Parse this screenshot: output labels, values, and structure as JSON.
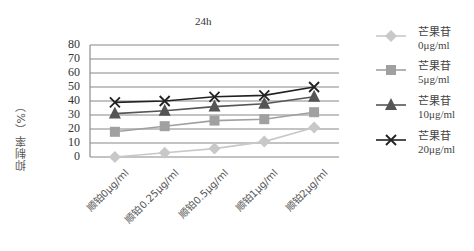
{
  "chart_data": {
    "type": "line",
    "title": "24h",
    "xlabel": "",
    "ylabel": "抑制率（%）",
    "ylim": [
      0,
      80
    ],
    "yticks": [
      0,
      10,
      20,
      30,
      40,
      50,
      60,
      70,
      80
    ],
    "grid": true,
    "legend_position": "right",
    "categories": [
      "顺铂0μg/ml",
      "顺铂0.25μg/ml",
      "顺铂0.5μg/ml",
      "顺铂1μg/ml",
      "顺铂2μg/ml"
    ],
    "series": [
      {
        "name": "芒果苷0μg/ml",
        "line1": "芒果苷",
        "line2": "0μg/ml",
        "marker": "diamond",
        "color": "#c8c8c8",
        "values": [
          0,
          3,
          6,
          11,
          21
        ]
      },
      {
        "name": "芒果苷5μg/ml",
        "line1": "芒果苷",
        "line2": "5μg/ml",
        "marker": "square",
        "color": "#a0a0a0",
        "values": [
          18,
          22,
          26,
          27,
          32
        ]
      },
      {
        "name": "芒果苷10μg/ml",
        "line1": "芒果苷",
        "line2": "10μg/ml",
        "marker": "triangle",
        "color": "#555555",
        "values": [
          31,
          33,
          36,
          38,
          43
        ]
      },
      {
        "name": "芒果苷20μg/ml",
        "line1": "芒果苷",
        "line2": "20μg/ml",
        "marker": "x",
        "color": "#222222",
        "values": [
          39,
          40,
          43,
          44,
          50
        ]
      }
    ]
  }
}
